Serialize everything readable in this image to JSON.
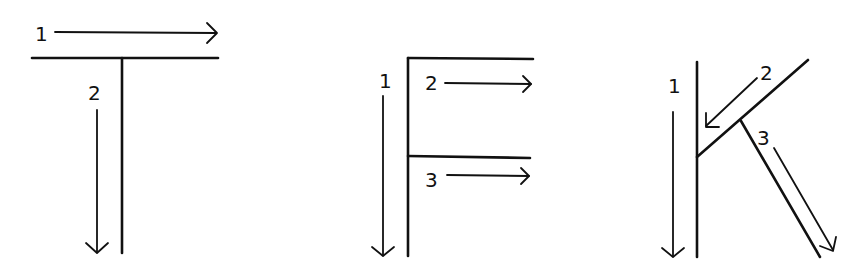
{
  "diagram": {
    "letters": [
      {
        "letter": "T",
        "strokes": [
          {
            "order": "1",
            "label": "1",
            "direction": "left-to-right",
            "type": "horizontal"
          },
          {
            "order": "2",
            "label": "2",
            "direction": "top-to-bottom",
            "type": "vertical"
          }
        ]
      },
      {
        "letter": "F",
        "strokes": [
          {
            "order": "1",
            "label": "1",
            "direction": "top-to-bottom",
            "type": "vertical"
          },
          {
            "order": "2",
            "label": "2",
            "direction": "left-to-right",
            "type": "top horizontal"
          },
          {
            "order": "3",
            "label": "3",
            "direction": "left-to-right",
            "type": "middle horizontal"
          }
        ]
      },
      {
        "letter": "K",
        "strokes": [
          {
            "order": "1",
            "label": "1",
            "direction": "top-to-bottom",
            "type": "vertical"
          },
          {
            "order": "2",
            "label": "2",
            "direction": "upper-right to middle-left",
            "type": "diagonal"
          },
          {
            "order": "3",
            "label": "3",
            "direction": "middle to lower-right",
            "type": "diagonal"
          }
        ]
      }
    ],
    "colors": {
      "ink": "#111111",
      "background": "#ffffff"
    }
  }
}
